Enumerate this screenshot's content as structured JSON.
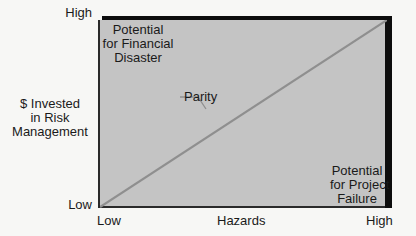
{
  "diagram": {
    "y_axis": {
      "label_lines": [
        "$ Invested",
        "in Risk",
        "Management"
      ],
      "high": "High",
      "low": "Low"
    },
    "x_axis": {
      "label": "Hazards",
      "low": "Low",
      "high": "High"
    },
    "regions": {
      "top_left": [
        "Potential",
        "for Financial",
        "Disaster"
      ],
      "bottom_right": [
        "Potential",
        "for Project",
        "Failure"
      ]
    },
    "line": {
      "label": "Parity",
      "from": "low-low",
      "to": "high-high"
    },
    "colors": {
      "plot_fill": "#c4c4c4",
      "shadow": "#0d0d0d",
      "parity_line": "#8f8f8f",
      "background": "#f7f7f5"
    }
  }
}
